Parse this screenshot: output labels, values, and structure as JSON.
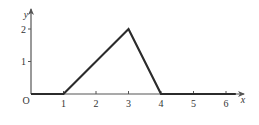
{
  "chart_data": {
    "type": "line",
    "title": "",
    "xlabel": "x",
    "ylabel": "y",
    "origin_label": "O",
    "x_ticks": [
      "1",
      "2",
      "3",
      "4",
      "5",
      "6"
    ],
    "y_ticks": [
      "1",
      "2"
    ],
    "xlim": [
      0,
      6.5
    ],
    "ylim": [
      0,
      2.5
    ],
    "grid": false,
    "series": [
      {
        "name": "f(x)",
        "points": [
          [
            0,
            0
          ],
          [
            1,
            0
          ],
          [
            3,
            2
          ],
          [
            4,
            0
          ],
          [
            6.3,
            0
          ]
        ]
      }
    ],
    "colors": {
      "line": "#2b2b2b",
      "axis": "#555555",
      "text": "#333333"
    }
  }
}
